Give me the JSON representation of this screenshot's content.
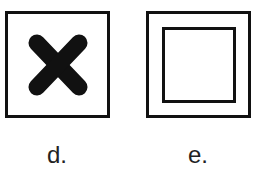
{
  "figures": [
    {
      "id": "d",
      "label": "d.",
      "icon": "x-cross-icon",
      "description": "square frame containing a bold rounded X"
    },
    {
      "id": "e",
      "label": "e.",
      "icon": "double-square-icon",
      "description": "square frame containing a smaller inner square"
    }
  ],
  "colors": {
    "stroke": "#111111",
    "background": "#ffffff"
  }
}
